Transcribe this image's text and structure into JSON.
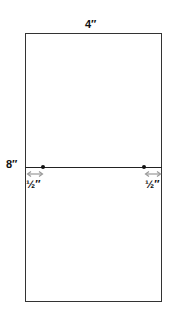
{
  "diagram": {
    "width_label": "4″",
    "height_label": "8″",
    "left_margin_label": "½″",
    "right_margin_label": "½″",
    "colors": {
      "outline": "#333333",
      "arrow": "#999999",
      "text": "#111111"
    }
  }
}
